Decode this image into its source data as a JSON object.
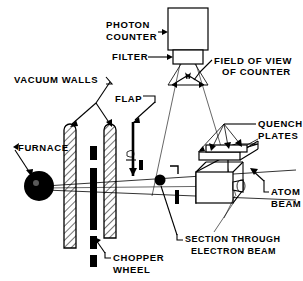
{
  "figure": {
    "type": "technical-line-diagram",
    "background_color": "#ffffff",
    "line_color": "#000000",
    "width": 303,
    "height": 281
  },
  "labels": {
    "photon_counter": "PHOTON\nCOUNTER",
    "photon_counter_line1": "PHOTON",
    "photon_counter_line2": "COUNTER",
    "filter": "FILTER",
    "field_of_view_line1": "FIELD OF VIEW",
    "field_of_view_line2": "OF COUNTER",
    "vacuum_walls": "VACUUM WALLS",
    "flap": "FLAP",
    "quench_plates_line1": "QUENCH",
    "quench_plates_line2": "PLATES",
    "furnace": "FURNACE",
    "atom_beam_line1": "ATOM",
    "atom_beam_line2": "BEAM",
    "section_through_line1": "SECTION THROUGH",
    "section_through_line2": "ELECTRON  BEAM",
    "chopper_wheel_line1": "CHOPPER",
    "chopper_wheel_line2": "WHEEL"
  },
  "components": [
    {
      "name": "photon-counter",
      "label": "PHOTON COUNTER",
      "shape": "rectangle"
    },
    {
      "name": "filter",
      "label": "FILTER",
      "shape": "rectangle"
    },
    {
      "name": "field-of-view-cone",
      "label": "FIELD OF VIEW OF COUNTER",
      "shape": "cone"
    },
    {
      "name": "vacuum-wall-left",
      "label": "VACUUM WALLS",
      "shape": "hatched-bar"
    },
    {
      "name": "vacuum-wall-right",
      "label": "VACUUM WALLS",
      "shape": "hatched-bar"
    },
    {
      "name": "flap",
      "label": "FLAP",
      "shape": "vertical-bar"
    },
    {
      "name": "furnace",
      "label": "FURNACE",
      "shape": "filled-circle"
    },
    {
      "name": "chopper-wheel",
      "label": "CHOPPER WHEEL",
      "shape": "segmented-bar"
    },
    {
      "name": "quench-plates",
      "label": "QUENCH PLATES",
      "shape": "plate-stack"
    },
    {
      "name": "electron-beam-section",
      "label": "SECTION THROUGH ELECTRON BEAM",
      "shape": "filled-dot"
    },
    {
      "name": "atom-beam",
      "label": "ATOM BEAM",
      "shape": "beam-lines"
    },
    {
      "name": "electron-beam-box",
      "label": "electron beam chamber",
      "shape": "box-3d"
    }
  ]
}
